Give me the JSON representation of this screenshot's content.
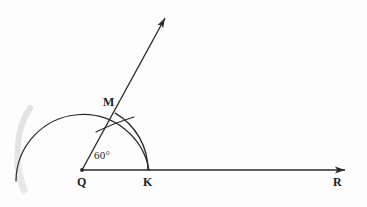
{
  "figure": {
    "type": "geometry-construction-diagram",
    "background_color": "#fdfdfd",
    "ink_color": "#2a2a2a",
    "smudge_color": "#b8b8b8",
    "labels": {
      "vertex_q": "Q",
      "point_k": "K",
      "point_m": "M",
      "ray_end_r": "R",
      "angle_measure": "60°"
    },
    "points": {
      "Q": {
        "x": 82,
        "y": 170
      },
      "K": {
        "x": 148,
        "y": 170
      },
      "M": {
        "x": 115,
        "y": 122
      },
      "R": {
        "x": 350,
        "y": 170
      }
    },
    "elements": [
      {
        "name": "base-ray-QR",
        "kind": "ray",
        "from": "Q",
        "to": "R",
        "arrowhead": "end"
      },
      {
        "name": "upper-ray-QM",
        "kind": "ray",
        "from": "Q",
        "through": "M",
        "arrowhead": "end",
        "angle_degrees": 60
      },
      {
        "name": "large-construction-arc",
        "kind": "arc",
        "center": "Q",
        "radius": 67,
        "start_angle_degrees": 0,
        "end_angle_degrees": 190
      },
      {
        "name": "arc-M-to-K",
        "kind": "arc",
        "center": "Q",
        "radius": 66,
        "start_angle_degrees": 0,
        "end_angle_degrees": 62
      },
      {
        "name": "intersection-tick-at-M",
        "kind": "tick-mark",
        "at": "M"
      }
    ]
  }
}
